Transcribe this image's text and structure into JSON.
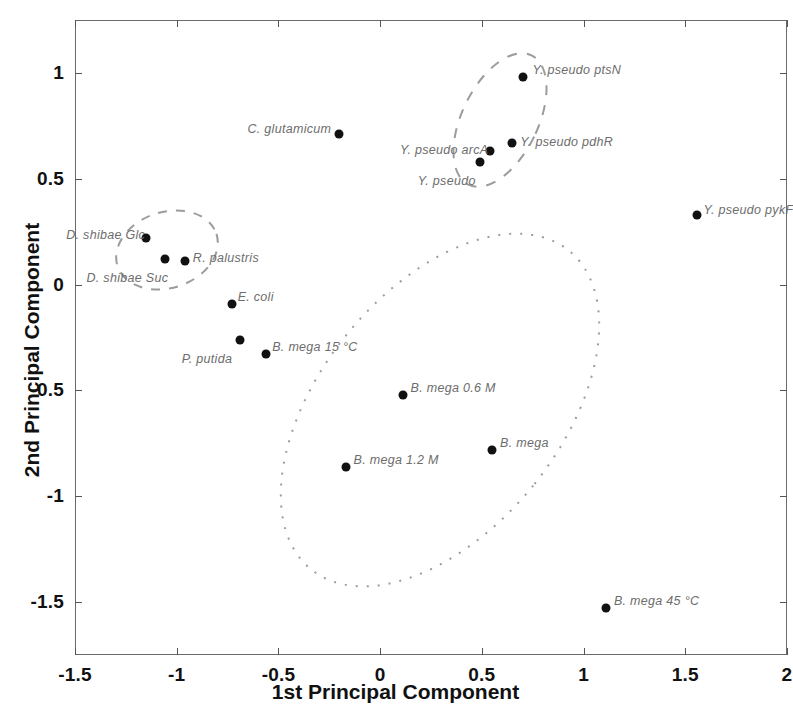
{
  "chart_data": {
    "type": "scatter",
    "title": "",
    "xlabel": "1st Principal Component",
    "ylabel": "2nd Principal Component",
    "xlim": [
      -1.5,
      2
    ],
    "ylim": [
      -1.75,
      1.25
    ],
    "xticks": [
      -1.5,
      -1,
      -0.5,
      0,
      0.5,
      1,
      1.5,
      2
    ],
    "xticklabels": [
      "-1.5",
      "-1",
      "-0.5",
      "0",
      "0.5",
      "1",
      "1.5",
      "2"
    ],
    "yticks": [
      1,
      0.5,
      0,
      -0.5,
      -1,
      -1.5
    ],
    "yticklabels": [
      "1",
      "0.5",
      "0",
      "-0.5",
      "-1",
      "-1.5"
    ],
    "grid": false,
    "legend": "none",
    "marker_color": "#111111",
    "label_color": "#6d6d6d",
    "points": [
      {
        "label": "Y. pseudo ptsN",
        "x": 0.7,
        "y": 0.98,
        "lx": 10,
        "ly": -14
      },
      {
        "label": "C. glutamicum",
        "x": -0.2,
        "y": 0.71,
        "lx": -92,
        "ly": -12
      },
      {
        "label": "Y. pseudo arcA",
        "x": 0.54,
        "y": 0.63,
        "lx": -90,
        "ly": -8
      },
      {
        "label": "Y. pseudo pdhR",
        "x": 0.65,
        "y": 0.67,
        "lx": 8,
        "ly": -8
      },
      {
        "label": "Y. pseudo",
        "x": 0.49,
        "y": 0.58,
        "lx": -62,
        "ly": 12
      },
      {
        "label": "Y. pseudo pykF",
        "x": 1.56,
        "y": 0.33,
        "lx": 6,
        "ly": -12
      },
      {
        "label": "D. shibae Glc",
        "x": -1.15,
        "y": 0.22,
        "lx": -80,
        "ly": -10
      },
      {
        "label": "R. palustris",
        "x": -0.96,
        "y": 0.11,
        "lx": 8,
        "ly": -10
      },
      {
        "label": "D. shibae Suc",
        "x": -1.06,
        "y": 0.12,
        "lx": -78,
        "ly": 12
      },
      {
        "label": "E. coli",
        "x": -0.73,
        "y": -0.09,
        "lx": 6,
        "ly": -14
      },
      {
        "label": "P. putida",
        "x": -0.69,
        "y": -0.26,
        "lx": -58,
        "ly": 12
      },
      {
        "label": "B. mega 15 °C",
        "x": -0.56,
        "y": -0.33,
        "lx": 6,
        "ly": -14
      },
      {
        "label": "B. mega 0.6 M",
        "x": 0.11,
        "y": -0.52,
        "lx": 8,
        "ly": -14
      },
      {
        "label": "B. mega",
        "x": 0.55,
        "y": -0.78,
        "lx": 8,
        "ly": -14
      },
      {
        "label": "B. mega 1.2 M",
        "x": -0.17,
        "y": -0.86,
        "lx": 8,
        "ly": -14
      },
      {
        "label": "B. mega 45 °C",
        "x": 1.11,
        "y": -1.53,
        "lx": 8,
        "ly": -14
      }
    ],
    "annotations": [
      {
        "name": "d-shibae-cluster",
        "style": "dashed"
      },
      {
        "name": "y-pseudo-cluster",
        "style": "dashed"
      },
      {
        "name": "b-mega-cluster",
        "style": "dotted"
      }
    ]
  }
}
